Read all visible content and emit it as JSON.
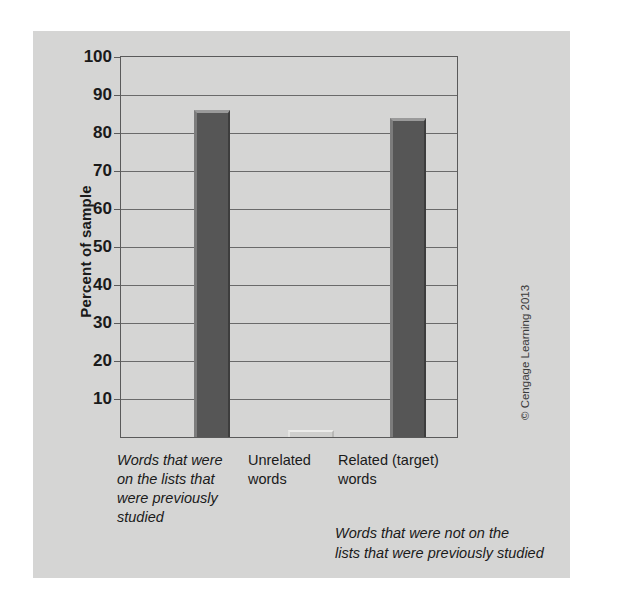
{
  "chart_data": {
    "type": "bar",
    "title": "",
    "xlabel": "",
    "ylabel": "Percent of sample",
    "ylim": [
      0,
      100
    ],
    "ytick_step": 10,
    "yticks": [
      10,
      20,
      30,
      40,
      50,
      60,
      70,
      80,
      90,
      100
    ],
    "grid": true,
    "legend": "none",
    "categories": [
      "Words that were on the lists that were previously studied",
      "Unrelated words",
      "Related (target) words"
    ],
    "category_lines": [
      [
        "Words that were",
        "on the lists that",
        "were previously",
        "studied"
      ],
      [
        "Unrelated",
        "words"
      ],
      [
        "Related (target)",
        "words"
      ]
    ],
    "values": [
      86,
      1,
      84
    ],
    "bar_color": "#565656",
    "bar_color_small": "#cfcfcd",
    "annotations": [
      {
        "text": "Words that were not on the lists that were previously studied",
        "lines": [
          "Words that were not on the",
          "lists that were previously studied"
        ],
        "applies_to": [
          "Unrelated words",
          "Related (target) words"
        ]
      }
    ]
  },
  "figure": {
    "panel_color": "#d5d5d4",
    "axis_color": "#5a5a5a",
    "credit": "© Cengage Learning 2013"
  }
}
